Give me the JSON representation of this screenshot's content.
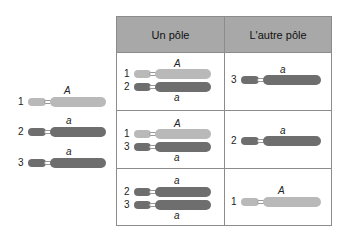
{
  "header": {
    "col1": "Un pôle",
    "col2": "L'autre pôle"
  },
  "left": [
    {
      "num": "1",
      "allele": "A",
      "shade": "light"
    },
    {
      "num": "2",
      "allele": "a",
      "shade": "dark"
    },
    {
      "num": "3",
      "allele": "a",
      "shade": "dark"
    }
  ],
  "rows": [
    {
      "pole1": [
        {
          "num": "1",
          "allele": "A"
        },
        {
          "num": "2",
          "allele": "a"
        }
      ],
      "pole2": {
        "num": "3",
        "allele": "a"
      }
    },
    {
      "pole1": [
        {
          "num": "1",
          "allele": "A"
        },
        {
          "num": "3",
          "allele": "a"
        }
      ],
      "pole2": {
        "num": "2",
        "allele": "a"
      }
    },
    {
      "pole1": [
        {
          "num": "2",
          "allele": "a"
        },
        {
          "num": "3",
          "allele": "a"
        }
      ],
      "pole2": {
        "num": "1",
        "allele": "A"
      }
    }
  ],
  "colors": {
    "light": "#b9b9b9",
    "dark": "#6e6e6e",
    "header": "#a8a8a8"
  }
}
